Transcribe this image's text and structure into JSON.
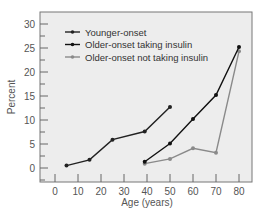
{
  "chart_data": {
    "type": "line",
    "title": "",
    "xlabel": "Age (years)",
    "ylabel": "Percent",
    "xlim": [
      -7,
      86
    ],
    "ylim": [
      -3,
      32
    ],
    "xticks": [
      0,
      10,
      20,
      30,
      40,
      50,
      60,
      70,
      80
    ],
    "yticks": [
      0,
      5,
      10,
      15,
      20,
      25,
      30
    ],
    "grid": false,
    "legend_position": "upper left",
    "series": [
      {
        "name": "Younger-onset",
        "color": "#222222",
        "x": [
          5,
          15,
          25,
          39,
          50
        ],
        "values": [
          0.5,
          1.7,
          5.9,
          7.6,
          12.7
        ]
      },
      {
        "name": "Older-onset taking insulin",
        "color": "#111111",
        "x": [
          39,
          50,
          60,
          70,
          80
        ],
        "values": [
          1.3,
          5.1,
          10.2,
          15.2,
          25.2
        ]
      },
      {
        "name": "Older-onset not taking insulin",
        "color": "#8a8a8a",
        "x": [
          39,
          50,
          60,
          70,
          80
        ],
        "values": [
          0.9,
          1.9,
          4.1,
          3.2,
          24.3
        ]
      }
    ]
  },
  "colors": {
    "plot_background": "#ededed",
    "axis": "#666666"
  }
}
